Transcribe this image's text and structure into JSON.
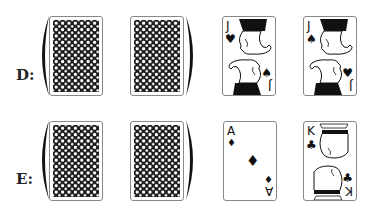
{
  "rows": [
    {
      "label": "D:",
      "cards": [
        {
          "type": "back",
          "pattern": "black-white-dot-lattice"
        },
        {
          "type": "back",
          "pattern": "black-white-dot-lattice"
        },
        {
          "type": "face",
          "rank": "J",
          "top_left_suit": "♥",
          "bottom_right_suit": "♠",
          "bottom_right_suit_orientation": "upright",
          "picture": "jack"
        },
        {
          "type": "face",
          "rank": "J",
          "top_left_suit": "♠",
          "bottom_right_suit": "♥",
          "bottom_right_suit_orientation": "upright",
          "picture": "jack"
        }
      ],
      "bracket": "encloses-first-two-cards"
    },
    {
      "label": "E:",
      "cards": [
        {
          "type": "back",
          "pattern": "black-white-dot-lattice"
        },
        {
          "type": "back",
          "pattern": "black-white-dot-lattice"
        },
        {
          "type": "face",
          "rank": "A",
          "top_left_suit": "♦",
          "bottom_right_suit": "♦",
          "center_suit": "♦",
          "picture": "ace"
        },
        {
          "type": "face",
          "rank": "K",
          "top_left_suit": "♣",
          "bottom_right_suit": "♣",
          "picture": "king"
        }
      ],
      "bracket": "encloses-first-two-cards"
    }
  ],
  "colors": {
    "ink": "#111111",
    "card_border": "#888888",
    "background": "#ffffff"
  }
}
